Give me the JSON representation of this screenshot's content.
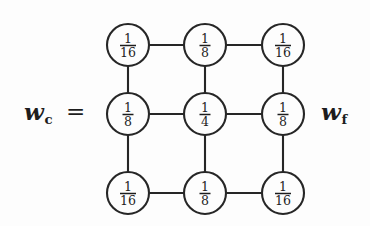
{
  "figure": {
    "left_label": {
      "base": "w",
      "subscript": "c",
      "full": "w_c"
    },
    "equals": "=",
    "right_label": {
      "base": "w",
      "subscript": "f",
      "full": "w_f"
    }
  },
  "chart_data": {
    "type": "diagram",
    "title": "",
    "grid": {
      "rows": 3,
      "cols": 3,
      "node_radius": 21,
      "x_centers": [
        128,
        205,
        283
      ],
      "y_centers": [
        45,
        114,
        193
      ]
    },
    "nodes": [
      {
        "row": 0,
        "col": 0,
        "numerator": "1",
        "denominator": "16",
        "value": 0.0625,
        "label": "1/16"
      },
      {
        "row": 0,
        "col": 1,
        "numerator": "1",
        "denominator": "8",
        "value": 0.125,
        "label": "1/8"
      },
      {
        "row": 0,
        "col": 2,
        "numerator": "1",
        "denominator": "16",
        "value": 0.0625,
        "label": "1/16"
      },
      {
        "row": 1,
        "col": 0,
        "numerator": "1",
        "denominator": "8",
        "value": 0.125,
        "label": "1/8"
      },
      {
        "row": 1,
        "col": 1,
        "numerator": "1",
        "denominator": "4",
        "value": 0.25,
        "label": "1/4"
      },
      {
        "row": 1,
        "col": 2,
        "numerator": "1",
        "denominator": "8",
        "value": 0.125,
        "label": "1/8"
      },
      {
        "row": 2,
        "col": 0,
        "numerator": "1",
        "denominator": "16",
        "value": 0.0625,
        "label": "1/16"
      },
      {
        "row": 2,
        "col": 1,
        "numerator": "1",
        "denominator": "8",
        "value": 0.125,
        "label": "1/8"
      },
      {
        "row": 2,
        "col": 2,
        "numerator": "1",
        "denominator": "16",
        "value": 0.0625,
        "label": "1/16"
      }
    ],
    "edges": [
      {
        "from": [
          0,
          0
        ],
        "to": [
          0,
          1
        ],
        "orientation": "horizontal"
      },
      {
        "from": [
          0,
          1
        ],
        "to": [
          0,
          2
        ],
        "orientation": "horizontal"
      },
      {
        "from": [
          1,
          0
        ],
        "to": [
          1,
          1
        ],
        "orientation": "horizontal"
      },
      {
        "from": [
          1,
          1
        ],
        "to": [
          1,
          2
        ],
        "orientation": "horizontal"
      },
      {
        "from": [
          2,
          0
        ],
        "to": [
          2,
          1
        ],
        "orientation": "horizontal"
      },
      {
        "from": [
          2,
          1
        ],
        "to": [
          2,
          2
        ],
        "orientation": "horizontal"
      },
      {
        "from": [
          0,
          0
        ],
        "to": [
          1,
          0
        ],
        "orientation": "vertical"
      },
      {
        "from": [
          1,
          0
        ],
        "to": [
          2,
          0
        ],
        "orientation": "vertical"
      },
      {
        "from": [
          0,
          1
        ],
        "to": [
          1,
          1
        ],
        "orientation": "vertical"
      },
      {
        "from": [
          1,
          1
        ],
        "to": [
          2,
          1
        ],
        "orientation": "vertical"
      },
      {
        "from": [
          0,
          2
        ],
        "to": [
          1,
          2
        ],
        "orientation": "vertical"
      },
      {
        "from": [
          1,
          2
        ],
        "to": [
          2,
          2
        ],
        "orientation": "vertical"
      }
    ],
    "colors": {
      "ink": "#262626",
      "background": "#fdfdfd",
      "text": "#1d1d1d"
    }
  }
}
